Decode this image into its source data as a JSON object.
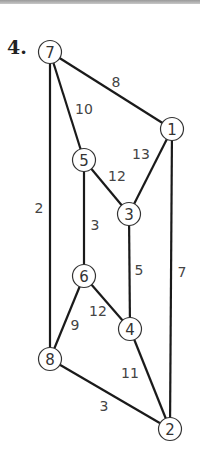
{
  "problem": {
    "number": "4."
  },
  "colors": {
    "edge": "#1a1a1a",
    "node_stroke": "#333333",
    "text": "#333333"
  },
  "nodes": [
    {
      "id": "7",
      "label": "7",
      "x": 50,
      "y": 52
    },
    {
      "id": "1",
      "label": "1",
      "x": 172,
      "y": 129
    },
    {
      "id": "5",
      "label": "5",
      "x": 84,
      "y": 160
    },
    {
      "id": "3",
      "label": "3",
      "x": 129,
      "y": 214
    },
    {
      "id": "6",
      "label": "6",
      "x": 84,
      "y": 276
    },
    {
      "id": "4",
      "label": "4",
      "x": 130,
      "y": 329
    },
    {
      "id": "8",
      "label": "8",
      "x": 50,
      "y": 359
    },
    {
      "id": "2",
      "label": "2",
      "x": 170,
      "y": 429
    }
  ],
  "edges": [
    {
      "from": "7",
      "to": "1",
      "weight": "8",
      "lx": 116,
      "ly": 82
    },
    {
      "from": "7",
      "to": "5",
      "weight": "10",
      "lx": 84,
      "ly": 109
    },
    {
      "from": "7",
      "to": "8",
      "weight": "2",
      "lx": 39,
      "ly": 208
    },
    {
      "from": "1",
      "to": "3",
      "weight": "13",
      "lx": 141,
      "ly": 154
    },
    {
      "from": "1",
      "to": "2",
      "weight": "7",
      "lx": 182,
      "ly": 272
    },
    {
      "from": "5",
      "to": "3",
      "weight": "12",
      "lx": 117,
      "ly": 176
    },
    {
      "from": "5",
      "to": "6",
      "weight": "3",
      "lx": 95,
      "ly": 225
    },
    {
      "from": "3",
      "to": "4",
      "weight": "5",
      "lx": 139,
      "ly": 270
    },
    {
      "from": "6",
      "to": "4",
      "weight": "12",
      "lx": 98,
      "ly": 311
    },
    {
      "from": "6",
      "to": "8",
      "weight": "9",
      "lx": 75,
      "ly": 325
    },
    {
      "from": "4",
      "to": "2",
      "weight": "11",
      "lx": 130,
      "ly": 373
    },
    {
      "from": "8",
      "to": "2",
      "weight": "3",
      "lx": 104,
      "ly": 406
    }
  ]
}
